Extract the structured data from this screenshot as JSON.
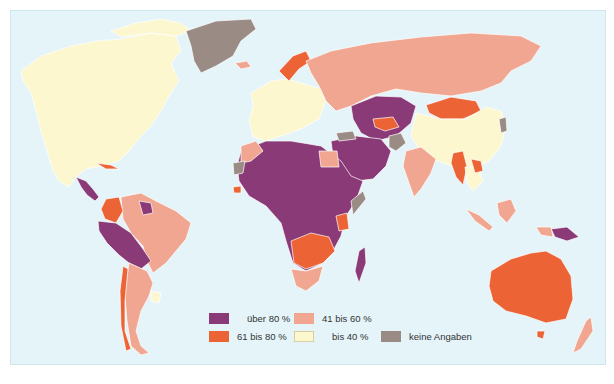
{
  "map": {
    "colors": {
      "ocean": "#e4f4f8",
      "over_80": "#8b3a78",
      "61_80": "#ec6436",
      "41_60": "#f0a690",
      "to_40": "#fdf7cf",
      "no_data": "#9a8c85"
    },
    "legend": [
      {
        "key": "over_80",
        "label": "über 80 %",
        "color": "#8b3a78"
      },
      {
        "key": "41_60",
        "label": "41 bis 60 %",
        "color": "#f0a690"
      },
      {
        "key": "61_80",
        "label": "61 bis 80 %",
        "color": "#ec6436"
      },
      {
        "key": "to_40",
        "label": "bis 40 %",
        "color": "#fdf7cf"
      },
      {
        "key": "no_data",
        "label": "keine Angaben",
        "color": "#9a8c85"
      }
    ],
    "regions": [
      {
        "name": "North America",
        "class": "to_40"
      },
      {
        "name": "Greenland",
        "class": "no_data"
      },
      {
        "name": "Europe",
        "class": "to_40"
      },
      {
        "name": "Norway",
        "class": "61_80"
      },
      {
        "name": "Russia",
        "class": "41_60"
      },
      {
        "name": "Central Asia",
        "class": "over_80"
      },
      {
        "name": "Mongolia",
        "class": "61_80"
      },
      {
        "name": "China",
        "class": "to_40"
      },
      {
        "name": "India",
        "class": "41_60"
      },
      {
        "name": "Middle East",
        "class": "over_80"
      },
      {
        "name": "Afghanistan",
        "class": "no_data"
      },
      {
        "name": "Myanmar",
        "class": "61_80"
      },
      {
        "name": "Africa (most)",
        "class": "over_80"
      },
      {
        "name": "Southern Africa",
        "class": "61_80"
      },
      {
        "name": "South Africa",
        "class": "41_60"
      },
      {
        "name": "Madagascar",
        "class": "over_80"
      },
      {
        "name": "Brazil",
        "class": "41_60"
      },
      {
        "name": "Colombia",
        "class": "61_80"
      },
      {
        "name": "Peru / Bolivia",
        "class": "over_80"
      },
      {
        "name": "Argentina",
        "class": "41_60"
      },
      {
        "name": "Uruguay",
        "class": "to_40"
      },
      {
        "name": "Australia",
        "class": "61_80"
      },
      {
        "name": "Indonesia",
        "class": "41_60"
      },
      {
        "name": "Papua New Guinea",
        "class": "over_80"
      },
      {
        "name": "New Zealand",
        "class": "41_60"
      }
    ]
  },
  "caption": {
    "text": ""
  }
}
